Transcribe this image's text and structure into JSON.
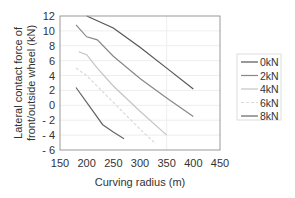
{
  "chart_data": {
    "type": "line",
    "title": "",
    "xlabel": "Curving radius (m)",
    "ylabel_line1": "Lateral contact force of",
    "ylabel_line2": "front/outside wheel (kN)",
    "ylabel": "Lateral contact force of front/outside wheel (kN)",
    "xlim": [
      150,
      450
    ],
    "ylim": [
      -6,
      12
    ],
    "xticks": [
      150,
      200,
      250,
      300,
      350,
      400,
      450
    ],
    "yticks": [
      -6,
      -4,
      -2,
      0,
      2,
      4,
      6,
      8,
      10,
      12
    ],
    "xtick_labels": [
      "150",
      "200",
      "250",
      "300",
      "350",
      "400",
      "450"
    ],
    "ytick_labels": [
      "- 6",
      "- 4",
      "- 2",
      "0",
      "2",
      "4",
      "6",
      "8",
      "10",
      "12"
    ],
    "grid": true,
    "legend_position": "right",
    "series": [
      {
        "name": "0kN",
        "color": "#555555",
        "dash": "",
        "x": [
          200,
          250,
          300,
          350,
          400
        ],
        "y": [
          12,
          10.4,
          7.8,
          5.0,
          2.2
        ]
      },
      {
        "name": "2kN",
        "color": "#888888",
        "dash": "",
        "x": [
          180,
          200,
          220,
          250,
          300,
          350,
          400
        ],
        "y": [
          10.8,
          9.2,
          8.8,
          6.6,
          3.6,
          1.0,
          -1.5
        ]
      },
      {
        "name": "4kN",
        "color": "#c4c4c4",
        "dash": "",
        "x": [
          185,
          200,
          220,
          250,
          300,
          350
        ],
        "y": [
          7.2,
          6.8,
          5.0,
          2.6,
          -0.8,
          -4.0
        ]
      },
      {
        "name": "6kN",
        "color": "#dadada",
        "dash": "3,2",
        "x": [
          180,
          200,
          250,
          300,
          330
        ],
        "y": [
          5.0,
          4.0,
          0.4,
          -3.2,
          -5.2
        ]
      },
      {
        "name": "8kN",
        "color": "#666666",
        "dash": "",
        "x": [
          180,
          200,
          230,
          250,
          270
        ],
        "y": [
          2.4,
          0.4,
          -2.6,
          -3.6,
          -4.5
        ]
      }
    ]
  }
}
